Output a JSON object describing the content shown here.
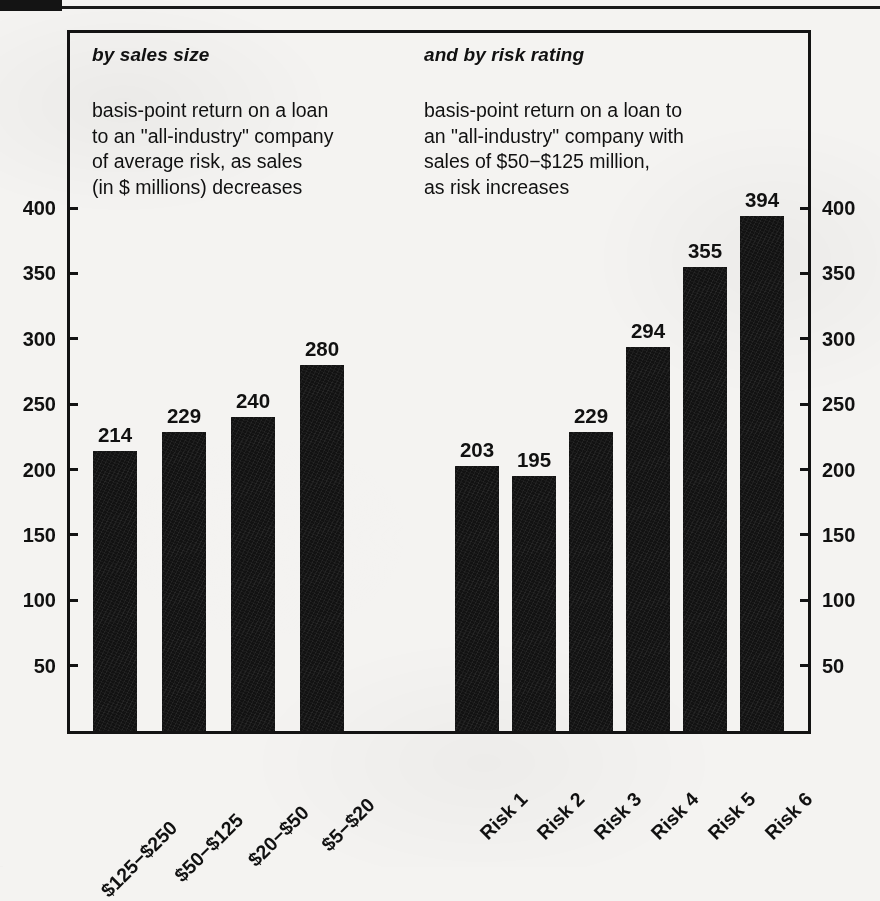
{
  "panels": {
    "left": {
      "heading": "by sales size",
      "description": "basis-point return on a loan\nto an \"all-industry\" company\nof average risk, as sales\n(in $ millions) decreases"
    },
    "right": {
      "heading": "and by risk rating",
      "description": "basis-point return on a loan to\nan \"all-industry\" company with\nsales of $50−$125 million,\nas risk increases"
    }
  },
  "axis": {
    "ticks": [
      "400",
      "350",
      "300",
      "250",
      "200",
      "150",
      "100",
      "50"
    ],
    "tick_values": [
      400,
      350,
      300,
      250,
      200,
      150,
      100,
      50
    ]
  },
  "colors": {
    "bar": "#121212",
    "frame": "#131313",
    "paper": "#f4f3f1",
    "ink": "#111111"
  },
  "chart_data": {
    "type": "bar",
    "title": "",
    "subtitle": "",
    "xlabel": "",
    "ylabel": "",
    "ylim": [
      0,
      440
    ],
    "grid": false,
    "legend": false,
    "axis_ticks": [
      50,
      100,
      150,
      200,
      250,
      300,
      350,
      400
    ],
    "dual_axis": true,
    "groups": [
      {
        "name": "by sales size",
        "caption": "basis-point return on a loan to an \"all-industry\" company of average risk, as sales (in $ millions) decreases",
        "categories": [
          "$125−$250",
          "$50−$125",
          "$20−$50",
          "$5−$20"
        ],
        "values": [
          214,
          229,
          240,
          280
        ]
      },
      {
        "name": "and by risk rating",
        "caption": "basis-point return on a loan to an \"all-industry\" company with sales of $50−$125 million, as risk increases",
        "categories": [
          "Risk 1",
          "Risk 2",
          "Risk 3",
          "Risk 4",
          "Risk 5",
          "Risk 6"
        ],
        "values": [
          203,
          195,
          229,
          294,
          355,
          394
        ]
      }
    ]
  }
}
